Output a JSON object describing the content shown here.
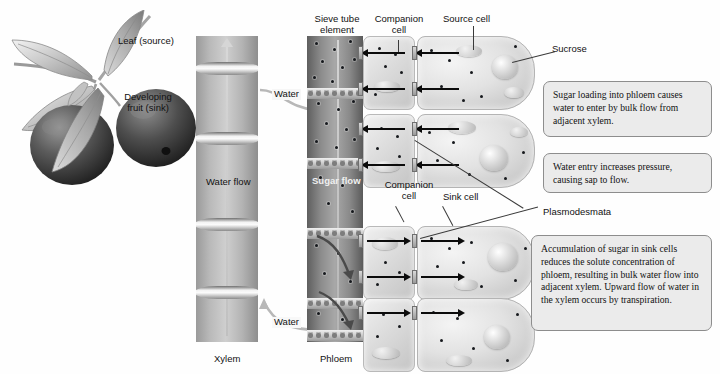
{
  "figure": {
    "domain_note": "Pressure-flow (bulk flow) model of phloem translocation"
  },
  "plant_labels": {
    "leaf_source": "Leaf (source)",
    "developing_fruit": "Developing\nfruit (sink)"
  },
  "column_labels": {
    "xylem": "Xylem",
    "phloem": "Phloem",
    "water_flow": "Water flow",
    "sugar_flow": "Sugar flow",
    "water_top": "Water",
    "water_bottom": "Water"
  },
  "cell_labels": {
    "sieve_tube_element": "Sieve tube\nelement",
    "companion_cell_top": "Companion\ncell",
    "source_cell": "Source cell",
    "sucrose": "Sucrose",
    "companion_cell_mid": "Companion\ncell",
    "sink_cell": "Sink cell",
    "plasmodesmata": "Plasmodesmata"
  },
  "callouts": [
    {
      "id": "callout-sugar-loading",
      "text": "Sugar loading into phloem causes water to enter by bulk flow from adjacent xylem."
    },
    {
      "id": "callout-water-entry",
      "text": "Water entry increases pressure, causing sap to flow."
    },
    {
      "id": "callout-sugar-accumulation",
      "text": "Accumulation of sugar in sink cells reduces the solute concentration of phloem, resulting in bulk water flow into adjacent xylem. Upward flow of water in the xylem occurs by transpiration."
    }
  ],
  "colors": {
    "callout_fill": "#ebebeb",
    "callout_border": "#8d8d8d",
    "arrow": "#0b0b0b",
    "sucrose_dot": "#17191d",
    "text": "#111111",
    "background": "#ffffff"
  }
}
